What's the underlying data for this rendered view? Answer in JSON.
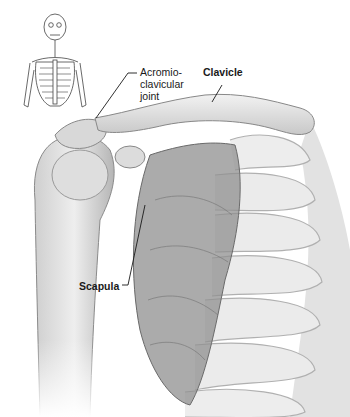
{
  "figure": {
    "labels": {
      "acromioclavicular_joint": [
        "Acromio-",
        "clavicular",
        "joint"
      ],
      "clavicle": "Clavicle",
      "scapula": "Scapula"
    },
    "inset": {
      "icon": "skeleton-icon",
      "highlight": "shoulder region"
    },
    "colors": {
      "background": "#ffffff",
      "bone": "#e6e6e6",
      "shade": "#9a9a9a",
      "scapula": "#8a8a8a",
      "line": "#1a1a1a"
    }
  }
}
